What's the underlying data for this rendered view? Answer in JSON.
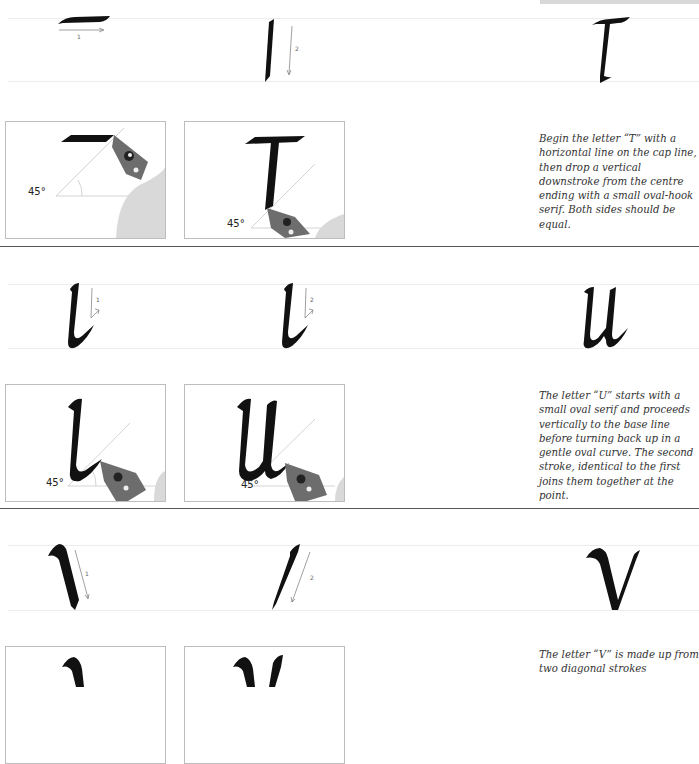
{
  "page": {
    "top_bar_color": "#d8d8d8",
    "rule_color": "#555555",
    "guide_color": "#ececec"
  },
  "sections": [
    {
      "letter": "T",
      "strokes": [
        {
          "number": "1",
          "direction": "right"
        },
        {
          "number": "2",
          "direction": "down"
        }
      ],
      "photos": [
        {
          "angle_label": "45°",
          "step": "first stroke"
        },
        {
          "angle_label": "45°",
          "step": "second stroke"
        }
      ],
      "caption": "Begin the letter “T” with a horizontal line on the cap line, then drop a vertical downstroke from the centre ending with a small oval-hook serif. Both sides should be equal."
    },
    {
      "letter": "U",
      "strokes": [
        {
          "number": "1",
          "direction": "down-up"
        },
        {
          "number": "2",
          "direction": "down-up"
        }
      ],
      "photos": [
        {
          "angle_label": "45°",
          "step": "first stroke"
        },
        {
          "angle_label": "45°",
          "step": "second stroke"
        }
      ],
      "caption": "The letter “U” starts with a small oval serif and proceeds vertically to the base line before turning back up in a gentle oval curve. The second stroke, identical to the first joins them together at the point."
    },
    {
      "letter": "V",
      "strokes": [
        {
          "number": "1",
          "direction": "down-right"
        },
        {
          "number": "2",
          "direction": "down-left"
        }
      ],
      "photos": [
        {
          "angle_label": "",
          "step": "first stroke"
        },
        {
          "angle_label": "",
          "step": "second stroke"
        }
      ],
      "caption": "The letter “V” is made up from two diagonal strokes"
    }
  ]
}
